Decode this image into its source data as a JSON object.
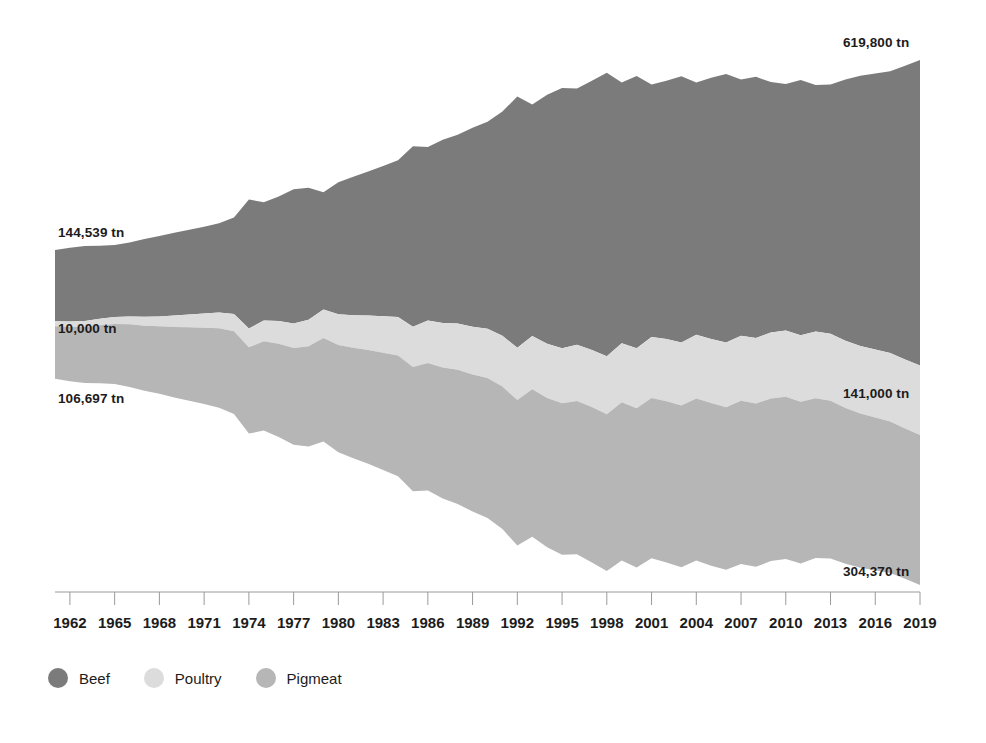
{
  "chart_data": {
    "type": "area",
    "subtype": "streamgraph",
    "title": "",
    "xlabel": "",
    "ylabel": "",
    "unit": "tn",
    "grid": false,
    "legend_position": "bottom-left",
    "x": [
      1961,
      1962,
      1963,
      1964,
      1965,
      1966,
      1967,
      1968,
      1969,
      1970,
      1971,
      1972,
      1973,
      1974,
      1975,
      1976,
      1977,
      1978,
      1979,
      1980,
      1981,
      1982,
      1983,
      1984,
      1985,
      1986,
      1987,
      1988,
      1989,
      1990,
      1991,
      1992,
      1993,
      1994,
      1995,
      1996,
      1997,
      1998,
      1999,
      2000,
      2001,
      2002,
      2003,
      2004,
      2005,
      2006,
      2007,
      2008,
      2009,
      2010,
      2011,
      2012,
      2013,
      2014,
      2015,
      2016,
      2017,
      2018,
      2019
    ],
    "xlim": [
      1961,
      2019
    ],
    "xtick_labels": [
      "1962",
      "1965",
      "1968",
      "1971",
      "1974",
      "1977",
      "1980",
      "1983",
      "1986",
      "1989",
      "1992",
      "1995",
      "1998",
      "2001",
      "2004",
      "2007",
      "2010",
      "2013",
      "2016",
      "2019"
    ],
    "xtick_values": [
      1962,
      1965,
      1968,
      1971,
      1974,
      1977,
      1980,
      1983,
      1986,
      1989,
      1992,
      1995,
      1998,
      2001,
      2004,
      2007,
      2010,
      2013,
      2016,
      2019
    ],
    "series": [
      {
        "name": "Beef",
        "color": "#7b7b7b",
        "values": [
          144539,
          150000,
          152000,
          148000,
          146000,
          150000,
          158000,
          163000,
          168000,
          172000,
          176000,
          181000,
          196000,
          262000,
          240000,
          253000,
          272000,
          268000,
          238000,
          268000,
          281000,
          292000,
          305000,
          318000,
          366000,
          352000,
          372000,
          383000,
          404000,
          420000,
          455000,
          510000,
          470000,
          505000,
          528000,
          520000,
          546000,
          575000,
          529000,
          552000,
          512000,
          524000,
          540000,
          512000,
          530000,
          545000,
          520000,
          530000,
          508000,
          500000,
          518000,
          500000,
          506000,
          530000,
          548000,
          560000,
          572000,
          596000,
          619800
        ]
      },
      {
        "name": "Poultry",
        "color": "#dcdcdc",
        "values": [
          10000,
          11000,
          12000,
          13000,
          14000,
          16000,
          18000,
          20000,
          23000,
          26000,
          29000,
          32000,
          35000,
          38000,
          42000,
          46000,
          50000,
          54000,
          58000,
          62000,
          66000,
          70000,
          74000,
          78000,
          82000,
          86000,
          90000,
          94000,
          97000,
          100000,
          103000,
          106000,
          108000,
          110000,
          112000,
          114000,
          116000,
          118000,
          120000,
          122000,
          124000,
          126000,
          128000,
          129000,
          130000,
          131000,
          132000,
          133000,
          134000,
          134500,
          135000,
          135500,
          136000,
          136500,
          137000,
          138000,
          139000,
          140000,
          141000
        ]
      },
      {
        "name": "Pigmeat",
        "color": "#b6b6b6",
        "values": [
          106697,
          110000,
          114000,
          118000,
          122000,
          127000,
          132000,
          137000,
          143000,
          149000,
          155000,
          161000,
          168000,
          175000,
          181000,
          189000,
          196000,
          203000,
          210000,
          218000,
          224000,
          231000,
          238000,
          245000,
          252000,
          259000,
          266000,
          272000,
          278000,
          284000,
          289000,
          295000,
          299000,
          303000,
          307000,
          311000,
          315000,
          318000,
          321000,
          323000,
          325000,
          327000,
          328000,
          329000,
          330000,
          330000,
          331000,
          331000,
          330000,
          329000,
          328000,
          324000,
          320000,
          316000,
          313000,
          310000,
          307000,
          305000,
          304370
        ]
      }
    ],
    "annotations": [
      {
        "id": "beef-start",
        "text": "144,539 tn",
        "series": "Beef",
        "year": 1961,
        "value": 144539,
        "x": 58,
        "y": 225,
        "align": "left"
      },
      {
        "id": "poultry-start",
        "text": "10,000 tn",
        "series": "Poultry",
        "year": 1961,
        "value": 10000,
        "x": 58,
        "y": 321,
        "align": "left"
      },
      {
        "id": "pigmeat-start",
        "text": "106,697 tn",
        "series": "Pigmeat",
        "year": 1961,
        "value": 106697,
        "x": 58,
        "y": 391,
        "align": "left"
      },
      {
        "id": "beef-end",
        "text": "619,800 tn",
        "series": "Beef",
        "year": 2019,
        "value": 619800,
        "x": 843,
        "y": 35,
        "align": "left"
      },
      {
        "id": "poultry-end",
        "text": "141,000 tn",
        "series": "Poultry",
        "year": 2019,
        "value": 141000,
        "x": 843,
        "y": 386,
        "align": "left"
      },
      {
        "id": "pigmeat-end",
        "text": "304,370 tn",
        "series": "Pigmeat",
        "year": 2019,
        "value": 304370,
        "x": 843,
        "y": 564,
        "align": "left"
      }
    ]
  },
  "legend": {
    "items": [
      {
        "label": "Beef",
        "color": "#7b7b7b"
      },
      {
        "label": "Poultry",
        "color": "#dcdcdc"
      },
      {
        "label": "Pigmeat",
        "color": "#b6b6b6"
      }
    ]
  },
  "axis": {
    "line_color": "#9a9a9a",
    "tick_color": "#9a9a9a"
  },
  "plot_geometry": {
    "left": 55,
    "right": 920,
    "axis_y": 592,
    "tick_length": 13,
    "label_y": 614,
    "top_margin": 55,
    "bottom_margin": 580
  }
}
